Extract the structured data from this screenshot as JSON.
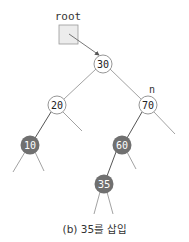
{
  "diagram": {
    "type": "binary-search-tree",
    "caption": "(b) 35를 삽입",
    "root_pointer": {
      "label": "root"
    },
    "pointer_n": {
      "label": "n"
    },
    "nodes": {
      "n30": {
        "value": "30",
        "state": "normal"
      },
      "n20": {
        "value": "20",
        "state": "normal"
      },
      "n70": {
        "value": "70",
        "state": "normal"
      },
      "n10": {
        "value": "10",
        "state": "highlighted"
      },
      "n60": {
        "value": "60",
        "state": "highlighted"
      },
      "n35": {
        "value": "35",
        "state": "highlighted"
      }
    },
    "edges": [
      [
        "30",
        "20"
      ],
      [
        "30",
        "70"
      ],
      [
        "20",
        "10"
      ],
      [
        "70",
        "60"
      ],
      [
        "60",
        "35"
      ]
    ],
    "colors": {
      "node_fill_normal": "#ffffff",
      "node_fill_highlight": "#707070",
      "node_stroke": "#8a8a8a",
      "edge": "#8a8a8a",
      "edge_highlight": "#555555",
      "root_box_fill": "#ececec"
    }
  }
}
